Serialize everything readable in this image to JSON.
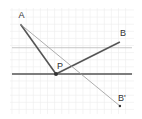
{
  "diagram": {
    "points": [
      {
        "id": "A",
        "label": "A",
        "x": -5,
        "y": 7
      },
      {
        "id": "P",
        "label": "P",
        "x": 0,
        "y": 0
      },
      {
        "id": "B",
        "label": "B",
        "x": 9,
        "y": 4.5
      },
      {
        "id": "Bp",
        "label": "B'",
        "x": 9,
        "y": -4.5
      }
    ],
    "lines": {
      "mirror_line_y": 0,
      "reference_line_y": 3.7
    },
    "segments": [
      {
        "from": "A",
        "to": "P",
        "style": "thick"
      },
      {
        "from": "P",
        "to": "B",
        "style": "thick"
      },
      {
        "from": "A",
        "to": "Bp",
        "style": "thin"
      }
    ],
    "colors": {
      "grid": "#ececec",
      "thick": "#555555",
      "thin": "#999999",
      "reference": "#b8b8b8"
    }
  }
}
